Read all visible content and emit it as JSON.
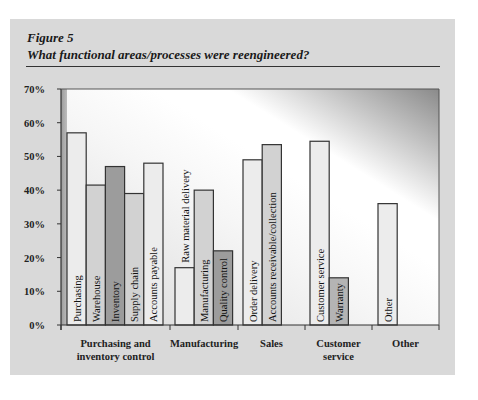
{
  "figure": {
    "label": "Figure 5",
    "title": "What functional areas/processes were reengineered?"
  },
  "chart_data": {
    "type": "bar",
    "title": "What functional areas/processes were reengineered?",
    "xlabel": "",
    "ylabel": "",
    "ylim": [
      0,
      70
    ],
    "yticks": [
      0,
      10,
      20,
      30,
      40,
      50,
      60,
      70
    ],
    "ytick_labels": [
      "0%",
      "10%",
      "20%",
      "30%",
      "40%",
      "50%",
      "60%",
      "70%"
    ],
    "grid": false,
    "legend": "none",
    "groups": [
      {
        "name": "Purchasing and inventory control",
        "label_lines": [
          "Purchasing and",
          "inventory control"
        ],
        "bars": [
          {
            "label": "Purchasing",
            "value": 57,
            "color": "#ececec"
          },
          {
            "label": "Warehouse",
            "value": 41.5,
            "color": "#d2d2d2"
          },
          {
            "label": "Inventory",
            "value": 47,
            "color": "#9c9c9c"
          },
          {
            "label": "Supply chain",
            "value": 39,
            "color": "#d2d2d2"
          },
          {
            "label": "Accounts payable",
            "value": 48,
            "color": "#ececec"
          }
        ]
      },
      {
        "name": "Manufacturing",
        "label_lines": [
          "Manufacturing"
        ],
        "bars": [
          {
            "label": "Raw material delivery",
            "value": 17,
            "color": "#ececec"
          },
          {
            "label": "Manufacturing",
            "value": 40,
            "color": "#d2d2d2"
          },
          {
            "label": "Quality control",
            "value": 22,
            "color": "#9c9c9c"
          }
        ]
      },
      {
        "name": "Sales",
        "label_lines": [
          "Sales"
        ],
        "bars": [
          {
            "label": "Order delivery",
            "value": 49,
            "color": "#ececec"
          },
          {
            "label": "Accounts receivable/collection",
            "value": 53.5,
            "color": "#d2d2d2"
          }
        ]
      },
      {
        "name": "Customer service",
        "label_lines": [
          "Customer",
          "service"
        ],
        "bars": [
          {
            "label": "Customer service",
            "value": 54.5,
            "color": "#ececec"
          },
          {
            "label": "Warranty",
            "value": 14,
            "color": "#b4b4b4"
          }
        ]
      },
      {
        "name": "Other",
        "label_lines": [
          "Other"
        ],
        "bars": [
          {
            "label": "Other",
            "value": 36,
            "color": "#ececec"
          }
        ]
      }
    ]
  }
}
